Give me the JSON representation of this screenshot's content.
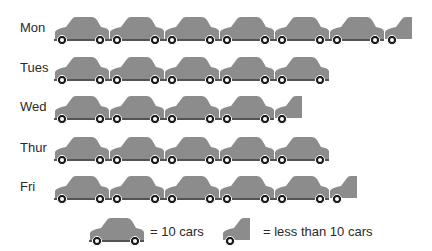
{
  "chart_data": {
    "type": "pictogram",
    "title": "",
    "unit": "cars",
    "icon": "car-icon",
    "icon_value": 10,
    "categories": [
      "Mon",
      "Tues",
      "Wed",
      "Thur",
      "Fri"
    ],
    "full_icons": [
      6,
      5,
      4,
      5,
      5
    ],
    "partial_icon": [
      true,
      false,
      true,
      false,
      true
    ],
    "values_estimate": [
      "60-69",
      "50",
      "40-49",
      "50",
      "50-59"
    ],
    "legend": [
      {
        "icon": "full-car",
        "label": "= 10 cars"
      },
      {
        "icon": "partial-car",
        "label": "= less than 10 cars"
      }
    ],
    "colors": {
      "car_body": "#8c8c8c",
      "wheel": "#1a1a1a",
      "hub": "#ffffff"
    }
  }
}
